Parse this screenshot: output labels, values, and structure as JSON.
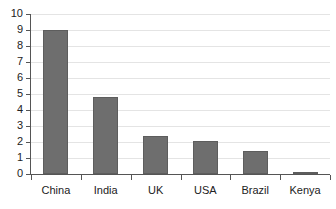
{
  "chart_data": {
    "type": "bar",
    "title": "",
    "subtitle": "",
    "xlabel": "",
    "ylabel": "",
    "categories": [
      "China",
      "India",
      "UK",
      "USA",
      "Brazil",
      "Kenya"
    ],
    "values": [
      9.0,
      4.8,
      2.4,
      2.05,
      1.45,
      0.1
    ],
    "series": [
      {
        "name": "",
        "values": [
          9.0,
          4.8,
          2.4,
          2.05,
          1.45,
          0.1
        ]
      }
    ],
    "ylim": [
      0,
      10
    ],
    "ytick_labels": [
      "0",
      "1",
      "2",
      "3",
      "4",
      "5",
      "6",
      "7",
      "8",
      "9",
      "10"
    ],
    "ytick_values": [
      0,
      1,
      2,
      3,
      4,
      5,
      6,
      7,
      8,
      9,
      10
    ],
    "grid": true,
    "grid_axis": "y",
    "legend": false,
    "legend_position": "none",
    "annotations": []
  },
  "style": {
    "bar_color": "#6e6e6e",
    "bar_edge_color": "#5d5d5d",
    "gridline_color": "#e4e4e4",
    "axis_color": "#555555",
    "text_color": "#222222",
    "background": "#ffffff"
  }
}
